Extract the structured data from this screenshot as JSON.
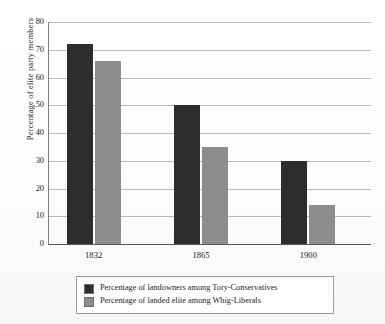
{
  "chart_data": {
    "type": "bar",
    "title": "",
    "xlabel": "",
    "ylabel": "Percentage of elite party members",
    "categories": [
      "1832",
      "1865",
      "1900"
    ],
    "ylim": [
      0,
      80
    ],
    "yticks": [
      "0",
      "10",
      "20",
      "30",
      "40",
      "50",
      "60",
      "70",
      "80"
    ],
    "ytick_values": [
      0,
      10,
      20,
      30,
      40,
      50,
      60,
      70,
      80
    ],
    "grid": true,
    "legend_position": "bottom",
    "series": [
      {
        "name": "Percentage of landowners among Tory-Conservatives",
        "color": "#2d2d2d",
        "values": [
          72,
          50,
          30
        ]
      },
      {
        "name": "Percentage of landed elite among Whig-Liberals",
        "color": "#8d8d8d",
        "values": [
          66,
          35,
          14
        ]
      }
    ]
  },
  "legend": {
    "items": [
      {
        "label": "Percentage of landowners among Tory-Conservatives"
      },
      {
        "label": "Percentage of landed elite among Whig-Liberals"
      }
    ]
  }
}
